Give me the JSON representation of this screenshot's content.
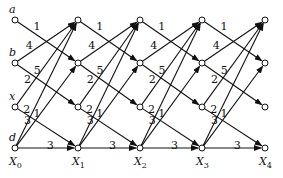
{
  "columns": [
    {
      "x": 15,
      "label": "X",
      "sub": "0"
    },
    {
      "x": 78,
      "label": "X",
      "sub": "1"
    },
    {
      "x": 140,
      "label": "X",
      "sub": "2"
    },
    {
      "x": 202,
      "label": "X",
      "sub": "3"
    },
    {
      "x": 265,
      "label": "X",
      "sub": "4"
    }
  ],
  "rows": [
    {
      "id": "a",
      "y": 20
    },
    {
      "id": "b",
      "y": 63
    },
    {
      "id": "x",
      "y": 107
    },
    {
      "id": "d",
      "y": 148
    }
  ],
  "row_labels_left": [
    "a",
    "b",
    "x",
    "d"
  ],
  "row_labels_right": {
    "a": "a"
  },
  "edges": [
    {
      "from": "a",
      "to": "b",
      "weight": "1"
    },
    {
      "from": "b",
      "to": "a",
      "weight": "4"
    },
    {
      "from": "b",
      "to": "x",
      "weight": "5"
    },
    {
      "from": "x",
      "to": "a",
      "weight": "2"
    },
    {
      "from": "x",
      "to": "d",
      "weight": "1"
    },
    {
      "from": "d",
      "to": "a",
      "weight": "2"
    },
    {
      "from": "d",
      "to": "b",
      "weight": "3"
    },
    {
      "from": "d",
      "to": "d",
      "weight": "3"
    }
  ],
  "colors": {
    "stroke": "#111111",
    "node_fill": "#ffffff"
  }
}
